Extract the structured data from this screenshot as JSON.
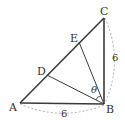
{
  "diagram": {
    "type": "geometry",
    "points": {
      "A": {
        "label": "A",
        "x": 20,
        "y": 103
      },
      "B": {
        "label": "B",
        "x": 104,
        "y": 104
      },
      "C": {
        "label": "C",
        "x": 104,
        "y": 18
      },
      "D": {
        "label": "D",
        "x": 47,
        "y": 75
      },
      "E": {
        "label": "E",
        "x": 79,
        "y": 42
      }
    },
    "segments": [
      {
        "from": "A",
        "to": "B",
        "style": "solid-thick"
      },
      {
        "from": "B",
        "to": "C",
        "style": "solid-thick"
      },
      {
        "from": "A",
        "to": "C",
        "style": "solid-thick"
      },
      {
        "from": "B",
        "to": "D",
        "style": "solid-thin"
      },
      {
        "from": "B",
        "to": "E",
        "style": "solid-thin"
      }
    ],
    "measurements": [
      {
        "between": "A-B",
        "value": "6"
      },
      {
        "between": "B-C",
        "value": "6"
      }
    ],
    "angle": {
      "label": "θ",
      "vertex": "B",
      "between": [
        "D",
        "E"
      ]
    },
    "colors": {
      "line": "#3a3a3a",
      "dashed": "#999999",
      "text": "#333333"
    }
  }
}
